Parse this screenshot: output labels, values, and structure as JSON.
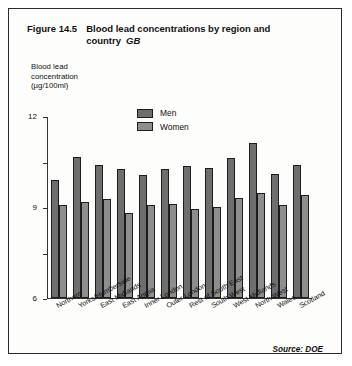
{
  "figure": {
    "number": "Figure 14.5",
    "title": "Blood lead concentrations by region and country",
    "scope": "GB",
    "source": "Source:  DOE"
  },
  "axis_caption": "Blood lead\nconcentration\n(µg/100ml)",
  "axis_caption_lines": [
    "Blood lead",
    "concentration",
    "(µg/100ml)"
  ],
  "legend": {
    "men_label": "Men",
    "women_label": "Women",
    "men_color": "#6e6e6e",
    "women_color": "#8e8e8e"
  },
  "chart_data": {
    "type": "bar",
    "subtitle": "GB",
    "xlabel": "",
    "ylabel": "Blood lead concentration (µg/100ml)",
    "ylim": [
      0,
      12
    ],
    "yticks": [
      0,
      3,
      6,
      9,
      12
    ],
    "ytick_labels": [
      "0",
      "3",
      "6",
      "9",
      "12"
    ],
    "grid": false,
    "legend_position": "top-center",
    "categories": [
      "Northern",
      "Yorks/Humberside",
      "East Midlands",
      "East Anglia",
      "Inner London",
      "Outer London",
      "Rest of South East",
      "South West",
      "West Midlands",
      "North West",
      "Wales",
      "Scotland"
    ],
    "series": [
      {
        "name": "Men",
        "color": "#6e6e6e",
        "values": [
          7.8,
          9.3,
          8.8,
          8.5,
          8.1,
          8.5,
          8.7,
          8.6,
          9.2,
          10.2,
          8.2,
          8.8
        ]
      },
      {
        "name": "Women",
        "color": "#8e8e8e",
        "values": [
          6.1,
          6.3,
          6.5,
          5.6,
          6.1,
          6.2,
          5.9,
          6.0,
          6.6,
          6.9,
          6.1,
          6.8
        ]
      }
    ],
    "annotations": [
      "Source: DOE"
    ]
  }
}
